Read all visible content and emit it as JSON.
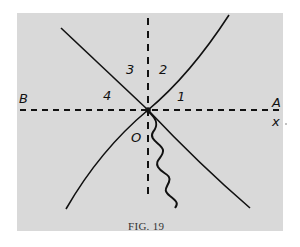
{
  "figure": {
    "caption": "FIG. 19",
    "caption_prefix": "FIG.",
    "caption_number": "19",
    "background_color": "#d9d9d9",
    "ink_color": "#111111"
  },
  "labels": {
    "left_axis_end": "B",
    "right_axis_end": "A",
    "axis_variable": "x",
    "origin": "O",
    "region_1": "1",
    "region_2": "2",
    "region_3": "3",
    "region_4": "4"
  },
  "elements": {
    "horizontal_axis": "dashed horizontal line B–A",
    "vertical_axis": "dashed vertical line through O",
    "worldline_left": "straight line from upper-left through O",
    "worldline_right_upper": "curve from O to upper-right",
    "worldline_left_lower": "curve from O to lower-left",
    "worldline_right_lower": "curve from O to lower-right",
    "wavy_line": "wavy line descending from O"
  }
}
